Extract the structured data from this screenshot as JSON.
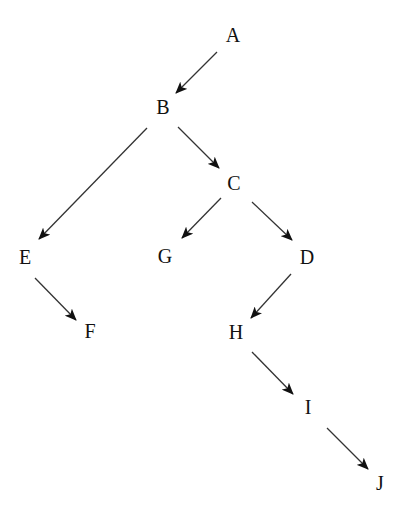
{
  "diagram": {
    "type": "tree",
    "colors": {
      "background": "#ffffff",
      "node_text": "#111111",
      "edge": "#333333"
    },
    "nodes": [
      {
        "id": "A",
        "label": "A",
        "x": 233,
        "y": 35
      },
      {
        "id": "B",
        "label": "B",
        "x": 163,
        "y": 107
      },
      {
        "id": "C",
        "label": "C",
        "x": 234,
        "y": 183
      },
      {
        "id": "E",
        "label": "E",
        "x": 25,
        "y": 257
      },
      {
        "id": "G",
        "label": "G",
        "x": 165,
        "y": 256
      },
      {
        "id": "D",
        "label": "D",
        "x": 307,
        "y": 257
      },
      {
        "id": "F",
        "label": "F",
        "x": 90,
        "y": 331
      },
      {
        "id": "H",
        "label": "H",
        "x": 236,
        "y": 332
      },
      {
        "id": "I",
        "label": "I",
        "x": 308,
        "y": 407
      },
      {
        "id": "J",
        "label": "J",
        "x": 380,
        "y": 483
      }
    ],
    "edges": [
      {
        "from": "A",
        "to": "B",
        "x1": 217,
        "y1": 52,
        "x2": 176,
        "y2": 93
      },
      {
        "from": "B",
        "to": "E",
        "x1": 147,
        "y1": 128,
        "x2": 39,
        "y2": 239
      },
      {
        "from": "B",
        "to": "C",
        "x1": 178,
        "y1": 127,
        "x2": 219,
        "y2": 168
      },
      {
        "from": "C",
        "to": "G",
        "x1": 221,
        "y1": 198,
        "x2": 182,
        "y2": 238
      },
      {
        "from": "C",
        "to": "D",
        "x1": 252,
        "y1": 202,
        "x2": 292,
        "y2": 240
      },
      {
        "from": "E",
        "to": "F",
        "x1": 35,
        "y1": 278,
        "x2": 76,
        "y2": 320
      },
      {
        "from": "D",
        "to": "H",
        "x1": 291,
        "y1": 274,
        "x2": 251,
        "y2": 318
      },
      {
        "from": "H",
        "to": "I",
        "x1": 252,
        "y1": 352,
        "x2": 293,
        "y2": 394
      },
      {
        "from": "I",
        "to": "J",
        "x1": 327,
        "y1": 428,
        "x2": 368,
        "y2": 469
      }
    ]
  }
}
